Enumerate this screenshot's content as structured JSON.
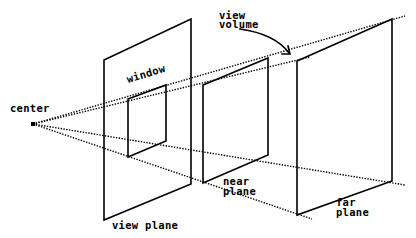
{
  "diagram": {
    "colors": {
      "line": "#000000",
      "background": "#ffffff"
    },
    "labels": {
      "center": "center",
      "window": "window",
      "view_volume_line1": "view",
      "view_volume_line2": "volume",
      "view_plane": "view plane",
      "near_plane_line1": "near",
      "near_plane_line2": "plane",
      "far_plane_line1": "far",
      "far_plane_line2": "plane"
    },
    "elements": [
      {
        "name": "center-of-projection",
        "type": "point"
      },
      {
        "name": "view-plane",
        "type": "parallelogram"
      },
      {
        "name": "window",
        "type": "rectangle-on-view-plane"
      },
      {
        "name": "near-plane",
        "type": "parallelogram"
      },
      {
        "name": "far-plane",
        "type": "parallelogram"
      },
      {
        "name": "projector-lines",
        "type": "dotted-lines",
        "count": 4
      },
      {
        "name": "view-volume-arrow",
        "type": "curved-arrow"
      }
    ]
  }
}
